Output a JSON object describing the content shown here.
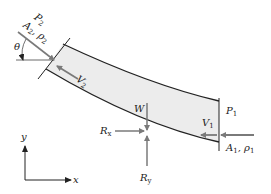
{
  "diagram": {
    "colors": {
      "pipe_fill": "#ececec",
      "pipe_wall": "#222222",
      "arrow": "#7a7a7a",
      "text": "#222222"
    },
    "labels": {
      "P2": {
        "main": "P",
        "sub": "2"
      },
      "A2": {
        "main": "A",
        "sub": "2"
      },
      "rho2": {
        "main": "ρ",
        "sub": "2"
      },
      "theta": "θ",
      "V2": {
        "main": "V",
        "sub": "2"
      },
      "W": "W",
      "Rx": {
        "main": "R",
        "sub": "x"
      },
      "Ry": {
        "main": "R",
        "sub": "y"
      },
      "P1": {
        "main": "P",
        "sub": "1"
      },
      "V1": {
        "main": "V",
        "sub": "1"
      },
      "A1": {
        "main": "A",
        "sub": "1"
      },
      "rho1": {
        "main": "ρ",
        "sub": "1"
      },
      "axis_x": "x",
      "axis_y": "y",
      "comma": ","
    }
  }
}
